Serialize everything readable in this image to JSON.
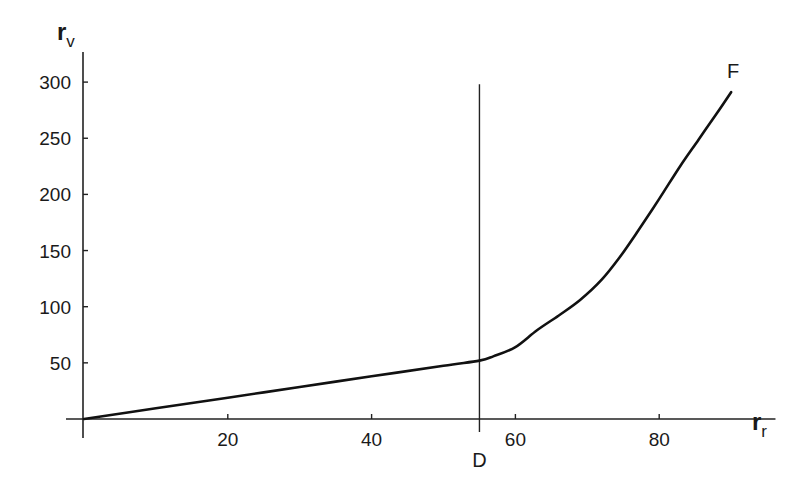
{
  "chart_data": {
    "type": "line",
    "title": "",
    "xlabel": "r_r",
    "ylabel": "r_v",
    "xlabel_parts": {
      "main": "r",
      "sub": "r"
    },
    "ylabel_parts": {
      "main": "r",
      "sub": "v"
    },
    "xlim": [
      0,
      92
    ],
    "ylim": [
      0,
      330
    ],
    "grid": false,
    "legend": null,
    "x_ticks": [
      20,
      40,
      60,
      80
    ],
    "y_ticks": [
      50,
      100,
      150,
      200,
      250,
      300
    ],
    "x_tick_labels": [
      "20",
      "40",
      "60",
      "80"
    ],
    "y_tick_labels": [
      "50",
      "100",
      "150",
      "200",
      "250",
      "300"
    ],
    "series": [
      {
        "name": "F",
        "x": [
          0,
          10,
          20,
          30,
          40,
          50,
          55,
          57,
          60,
          63,
          66,
          69,
          72,
          74.5,
          77,
          80,
          83,
          85.5,
          88,
          90
        ],
        "y": [
          0,
          9.5,
          19,
          28.5,
          38,
          47.5,
          52,
          56,
          64,
          79,
          92,
          106,
          124,
          144,
          167,
          196,
          226,
          249,
          272,
          291
        ]
      }
    ],
    "vertical_lines": [
      {
        "label": "D",
        "x": 55,
        "y_top": 298
      }
    ],
    "annotations": [
      {
        "text": "F",
        "x": 90,
        "y": 305
      },
      {
        "text": "D",
        "x": 55,
        "y": -30
      }
    ],
    "colors": {
      "line": "#111111",
      "axis": "#222222",
      "background": "#ffffff"
    }
  }
}
